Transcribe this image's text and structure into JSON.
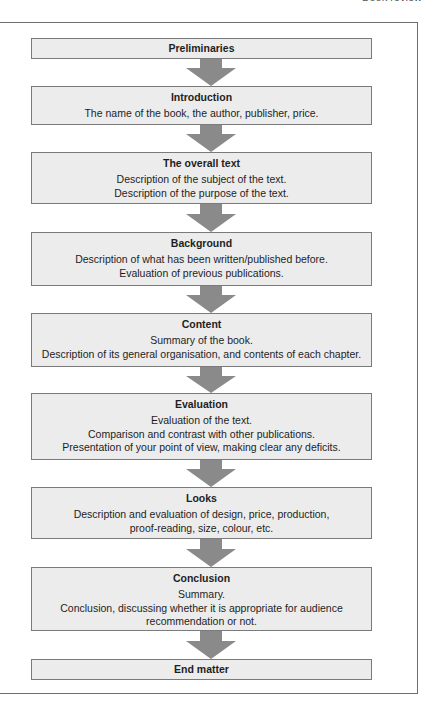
{
  "page": {
    "running_header": "Book review"
  },
  "diagram": {
    "type": "flowchart",
    "direction": "top-to-bottom",
    "colors": {
      "box_fill": "#ececec",
      "box_border": "#7a7a7a",
      "arrow": "#8a8a8a",
      "frame": "#6e6e6e"
    },
    "steps": [
      {
        "title": "Preliminaries",
        "lines": []
      },
      {
        "title": "Introduction",
        "lines": [
          "The name of the book, the author, publisher, price."
        ]
      },
      {
        "title": "The overall text",
        "lines": [
          "Description of the subject of the text.",
          "Description of the purpose of the text."
        ]
      },
      {
        "title": "Background",
        "lines": [
          "Description of what has been written/published before.",
          "Evaluation of previous publications."
        ]
      },
      {
        "title": "Content",
        "lines": [
          "Summary of the book.",
          "Description of its general organisation, and contents of each chapter."
        ]
      },
      {
        "title": "Evaluation",
        "lines": [
          "Evaluation of the text.",
          "Comparison and contrast with other publications.",
          "Presentation of your point of view, making clear any deficits."
        ]
      },
      {
        "title": "Looks",
        "lines": [
          "Description and evaluation of design, price, production,",
          "proof-reading, size, colour, etc."
        ]
      },
      {
        "title": "Conclusion",
        "lines": [
          "Summary.",
          "Conclusion, discussing whether it is appropriate for audience",
          "recommendation or not."
        ]
      },
      {
        "title": "End matter",
        "lines": []
      }
    ]
  }
}
